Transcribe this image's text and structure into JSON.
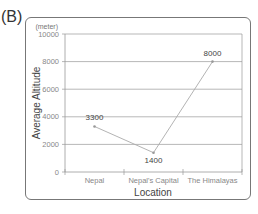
{
  "panel_label": "(B)",
  "chart_data": {
    "type": "line",
    "title": "",
    "xlabel": "Location",
    "ylabel": "Average Altitude",
    "y_unit": "(meter)",
    "categories": [
      "Nepal",
      "Nepal's  Capital",
      "The Himalayas"
    ],
    "series": [
      {
        "name": "Average Altitude",
        "values": [
          3300,
          1400,
          8000
        ]
      }
    ],
    "data_labels": [
      "3300",
      "1400",
      "8000"
    ],
    "yticks": [
      "0",
      "2000",
      "4000",
      "6000",
      "8000",
      "10000"
    ],
    "ylim": [
      0,
      10000
    ],
    "grid": true,
    "legend": "none"
  }
}
